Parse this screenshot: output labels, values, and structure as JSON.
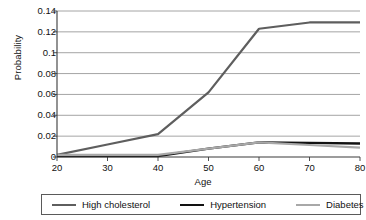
{
  "chart_data": {
    "type": "line",
    "title": "",
    "xlabel": "Age",
    "ylabel": "Probability",
    "x": [
      20,
      30,
      40,
      50,
      60,
      70,
      80
    ],
    "xlim": [
      20,
      80
    ],
    "ylim": [
      0,
      0.14
    ],
    "xticks": [
      "20",
      "30",
      "40",
      "50",
      "60",
      "70",
      "80"
    ],
    "yticks": [
      "0",
      "0.02",
      "0.04",
      "0.06",
      "0.08",
      "0.1",
      "0.12",
      "0.14"
    ],
    "grid": "horizontal",
    "legend_position": "bottom",
    "series": [
      {
        "name": "High cholesterol",
        "color": "#5e5e5e",
        "width": 2.2,
        "values": [
          0.002,
          0.012,
          0.022,
          0.062,
          0.123,
          0.129,
          0.129
        ]
      },
      {
        "name": "Hypertension",
        "color": "#121212",
        "width": 2.4,
        "values": [
          0.001,
          0.001,
          0.001,
          0.008,
          0.014,
          0.0135,
          0.013
        ]
      },
      {
        "name": "Diabetes",
        "color": "#a8a8a8",
        "width": 2.2,
        "values": [
          0.002,
          0.002,
          0.002,
          0.008,
          0.014,
          0.0115,
          0.009
        ]
      }
    ]
  },
  "axes": {
    "y_title": "Probability",
    "x_title": "Age",
    "y_tick_labels": [
      "0.14",
      "0.12",
      "0.1",
      "0.08",
      "0.06",
      "0.04",
      "0.02",
      "0"
    ],
    "x_tick_labels": [
      "20",
      "30",
      "40",
      "50",
      "60",
      "70",
      "80"
    ]
  },
  "legend": {
    "items": [
      {
        "label": "High cholesterol",
        "color": "#5e5e5e",
        "width": "2.2px"
      },
      {
        "label": "Hypertension",
        "color": "#121212",
        "width": "2.6px"
      },
      {
        "label": "Diabetes",
        "color": "#a8a8a8",
        "width": "2.2px"
      }
    ]
  },
  "colors": {
    "grid": "#8d8d8d",
    "axis": "#3a3a3a",
    "text": "#111111",
    "background": "#ffffff"
  }
}
